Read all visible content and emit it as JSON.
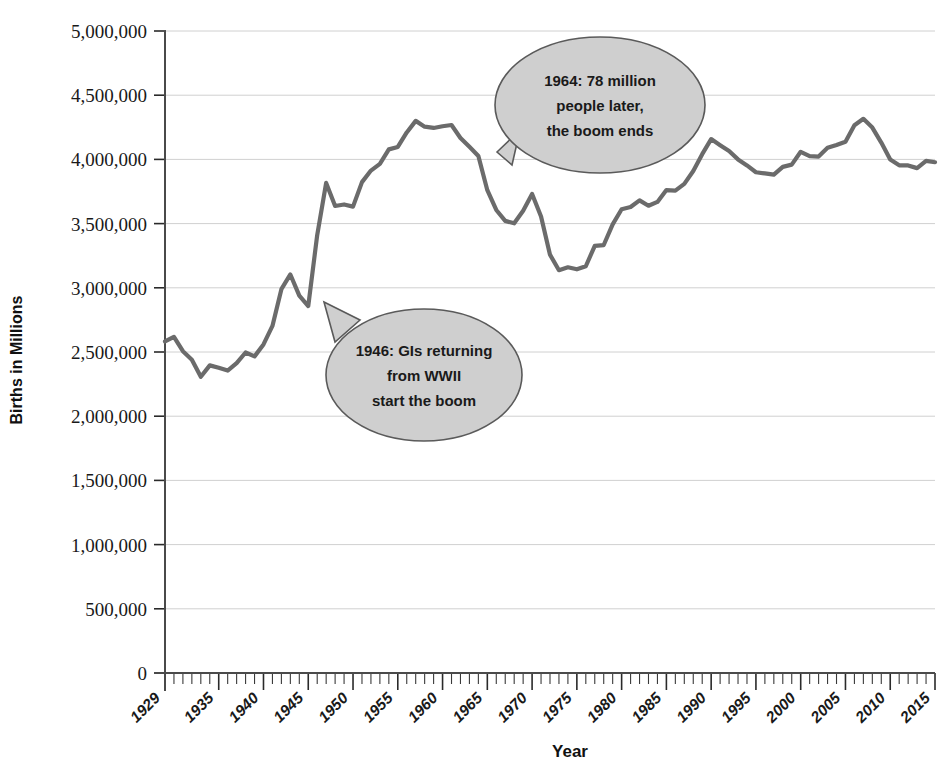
{
  "chart_data": {
    "type": "line",
    "title": "",
    "xlabel": "Year",
    "ylabel": "Births in Millions",
    "xlim": [
      1929,
      2015
    ],
    "ylim": [
      0,
      5000000
    ],
    "grid": true,
    "legend": "none",
    "y_ticks": [
      {
        "value": 0,
        "label": "0"
      },
      {
        "value": 500000,
        "label": "500,000"
      },
      {
        "value": 1000000,
        "label": "1,000,000"
      },
      {
        "value": 1500000,
        "label": "1,500,000"
      },
      {
        "value": 2000000,
        "label": "2,000,000"
      },
      {
        "value": 2500000,
        "label": "2,500,000"
      },
      {
        "value": 3000000,
        "label": "3,000,000"
      },
      {
        "value": 3500000,
        "label": "3,500,000"
      },
      {
        "value": 4000000,
        "label": "4,000,000"
      },
      {
        "value": 4500000,
        "label": "4,500,000"
      },
      {
        "value": 5000000,
        "label": "5,000,000"
      }
    ],
    "x_ticks_labeled": [
      "1929",
      "1935",
      "1940",
      "1945",
      "1950",
      "1955",
      "1960",
      "1965",
      "1970",
      "1975",
      "1980",
      "1985",
      "1990",
      "1995",
      "2000",
      "2005",
      "2010",
      "2015"
    ],
    "x_tick_values": [
      1929,
      1935,
      1940,
      1945,
      1950,
      1955,
      1960,
      1965,
      1970,
      1975,
      1980,
      1985,
      1990,
      1995,
      2000,
      2005,
      2010,
      2015
    ],
    "series": [
      {
        "name": "US Births",
        "color": "#6b6b6b",
        "x": [
          1929,
          1930,
          1931,
          1932,
          1933,
          1934,
          1935,
          1936,
          1937,
          1938,
          1939,
          1940,
          1941,
          1942,
          1943,
          1944,
          1945,
          1946,
          1947,
          1948,
          1949,
          1950,
          1951,
          1952,
          1953,
          1954,
          1955,
          1956,
          1957,
          1958,
          1959,
          1960,
          1961,
          1962,
          1963,
          1964,
          1965,
          1966,
          1967,
          1968,
          1969,
          1970,
          1971,
          1972,
          1973,
          1974,
          1975,
          1976,
          1977,
          1978,
          1979,
          1980,
          1981,
          1982,
          1983,
          1984,
          1985,
          1986,
          1987,
          1988,
          1989,
          1990,
          1991,
          1992,
          1993,
          1994,
          1995,
          1996,
          1997,
          1998,
          1999,
          2000,
          2001,
          2002,
          2003,
          2004,
          2005,
          2006,
          2007,
          2008,
          2009,
          2010,
          2011,
          2012,
          2013,
          2014,
          2015
        ],
        "y": [
          2582000,
          2618000,
          2506000,
          2440000,
          2307000,
          2396000,
          2377000,
          2355000,
          2413000,
          2496000,
          2466000,
          2559000,
          2703000,
          2989000,
          3104000,
          2939000,
          2858000,
          3411000,
          3817000,
          3637000,
          3649000,
          3632000,
          3823000,
          3913000,
          3965000,
          4078000,
          4097000,
          4210000,
          4300000,
          4255000,
          4245000,
          4258000,
          4268000,
          4167000,
          4098000,
          4027000,
          3760000,
          3606000,
          3521000,
          3502000,
          3600000,
          3731000,
          3556000,
          3258000,
          3137000,
          3160000,
          3144000,
          3168000,
          3327000,
          3333000,
          3494000,
          3612000,
          3629000,
          3681000,
          3639000,
          3669000,
          3761000,
          3757000,
          3809000,
          3910000,
          4041000,
          4158000,
          4111000,
          4065000,
          4000000,
          3953000,
          3900000,
          3891000,
          3881000,
          3942000,
          3959000,
          4059000,
          4026000,
          4022000,
          4090000,
          4112000,
          4138000,
          4266000,
          4316000,
          4248000,
          4131000,
          3999000,
          3954000,
          3953000,
          3932000,
          3988000,
          3978000
        ]
      }
    ],
    "annotations": [
      {
        "id": "boom-start",
        "lines": [
          "1946: GIs returning",
          "from WWII",
          "start the boom"
        ],
        "target_year": 1946,
        "target_value": 2858000
      },
      {
        "id": "boom-end",
        "lines": [
          "1964: 78 million",
          "people later,",
          "the boom ends"
        ],
        "target_year": 1964,
        "target_value": 4027000
      }
    ],
    "style": {
      "line_color": "#6b6b6b",
      "grid_color": "#d0d0d0",
      "axis_color": "#4a4a4a",
      "bubble_fill": "#cfcfcf",
      "bubble_stroke": "#5a5a5a",
      "background": "#ffffff"
    }
  }
}
